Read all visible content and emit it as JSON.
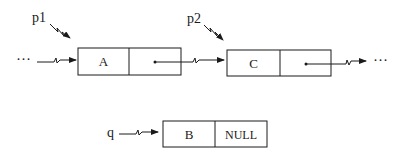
{
  "diagram": {
    "type": "linked-list-insertion",
    "nodes": [
      {
        "id": "A",
        "data": "A",
        "next_label": ""
      },
      {
        "id": "C",
        "data": "C",
        "next_label": ""
      },
      {
        "id": "B",
        "data": "B",
        "next_label": "NULL"
      }
    ],
    "pointers": [
      {
        "name": "p1",
        "target": "A"
      },
      {
        "name": "p2",
        "target": "C"
      },
      {
        "name": "q",
        "target": "B"
      }
    ],
    "ellipsis_left": "···",
    "ellipsis_right": "···"
  }
}
